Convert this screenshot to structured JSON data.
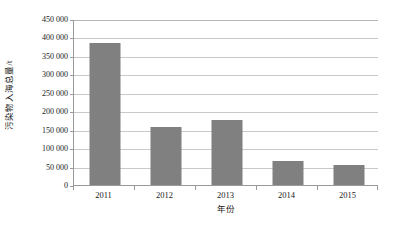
{
  "chart_data": {
    "type": "bar",
    "title": "",
    "xlabel": "年份",
    "ylabel": "污染物入海总量/t",
    "categories": [
      "2011",
      "2012",
      "2013",
      "2014",
      "2015"
    ],
    "values": [
      385000,
      157000,
      175000,
      65000,
      53000
    ],
    "series": [
      {
        "name": "污染物入海总量",
        "values": [
          385000,
          157000,
          175000,
          65000,
          53000
        ]
      }
    ],
    "ylim": [
      0,
      450000
    ],
    "ytick_step": 50000,
    "ytick_labels": [
      "450 000",
      "400 000",
      "350 000",
      "300 000",
      "250 000",
      "200 000",
      "150 000",
      "100 000",
      "50 000",
      "0"
    ],
    "ytick_values": [
      450000,
      400000,
      350000,
      300000,
      250000,
      200000,
      150000,
      100000,
      50000,
      0
    ],
    "grid": true,
    "legend": false,
    "legend_position": "none",
    "bar_color": "#808080",
    "gridline_color": "#c9c9c9",
    "axis_color": "#9a9a9a",
    "background_color": "#ffffff"
  }
}
